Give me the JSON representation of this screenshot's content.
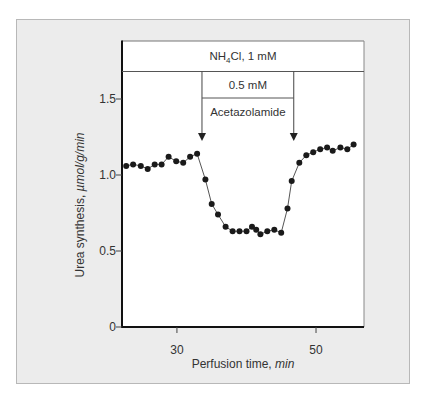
{
  "chart_data": {
    "type": "line",
    "title": "",
    "xlabel": "Perfusion time, min",
    "xlabel_main": "Perfusion time, ",
    "xlabel_unit": "min",
    "ylabel": "Urea synthesis, µmol/g/min",
    "ylabel_main": "Urea synthesis, ",
    "ylabel_unit": "µmol/g/min",
    "xlim": [
      22.1,
      56.9
    ],
    "ylim": [
      0,
      1.8
    ],
    "xticks": [
      30,
      50
    ],
    "yticks": [
      0,
      0.5,
      1.0,
      1.5
    ],
    "ytick_labels": [
      "0",
      "0.5",
      "1.0",
      "1.5"
    ],
    "xtick_labels": [
      "30",
      "50"
    ],
    "grid": false,
    "annotations": {
      "band_label": "NH4Cl, 1 mM",
      "inner_band_label": "0.5 mM",
      "drug_label": "Acetazolamide",
      "drug_start_min": 33.6,
      "drug_end_min": 46.8
    },
    "series": [
      {
        "name": "Urea synthesis",
        "x": [
          22.7,
          23.7,
          24.8,
          25.8,
          26.8,
          27.8,
          28.8,
          29.9,
          30.9,
          31.9,
          32.9,
          34.1,
          35.0,
          35.9,
          37.0,
          38.0,
          39.0,
          40.0,
          40.8,
          41.4,
          42.0,
          43.0,
          44.0,
          45.0,
          45.9,
          46.5,
          47.6,
          48.6,
          49.6,
          50.6,
          51.6,
          52.4,
          53.5,
          54.5,
          55.4
        ],
        "values": [
          1.06,
          1.07,
          1.06,
          1.04,
          1.07,
          1.07,
          1.12,
          1.09,
          1.08,
          1.12,
          1.14,
          0.97,
          0.81,
          0.74,
          0.66,
          0.63,
          0.63,
          0.63,
          0.66,
          0.64,
          0.61,
          0.63,
          0.64,
          0.62,
          0.78,
          0.96,
          1.08,
          1.13,
          1.15,
          1.17,
          1.18,
          1.16,
          1.18,
          1.17,
          1.2
        ]
      }
    ]
  }
}
